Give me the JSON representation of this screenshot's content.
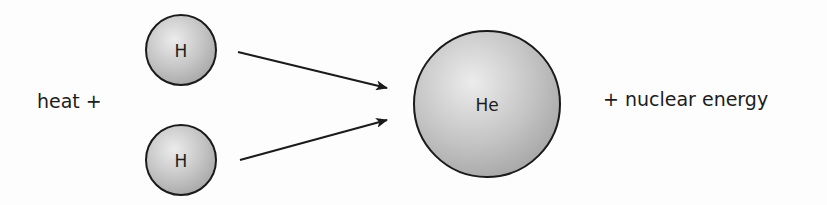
{
  "diagram": {
    "left_text": "heat +",
    "right_text": "+ nuclear energy",
    "reactants": [
      {
        "symbol": "H",
        "cx": 181,
        "cy": 50,
        "r": 35
      },
      {
        "symbol": "H",
        "cx": 181,
        "cy": 160,
        "r": 35
      }
    ],
    "product": {
      "symbol": "He",
      "cx": 487,
      "cy": 104,
      "r": 73
    },
    "arrows": [
      {
        "from": [
          238,
          52
        ],
        "to": [
          387,
          88
        ]
      },
      {
        "from": [
          240,
          160
        ],
        "to": [
          387,
          120
        ]
      }
    ],
    "colors": {
      "atom_fill_light": "#e6e6e6",
      "atom_fill_dark": "#a9a9a9",
      "stroke": "#1a1a1a",
      "text": "#1c1c1c"
    }
  }
}
